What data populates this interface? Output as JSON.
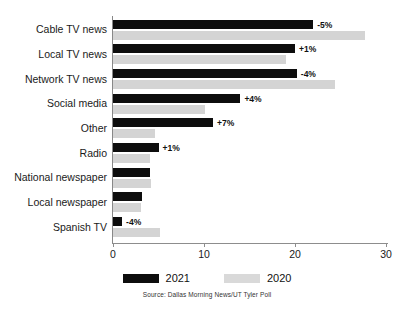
{
  "chart_data": {
    "type": "bar",
    "orientation": "horizontal",
    "title": "",
    "xlabel": "",
    "ylabel": "",
    "xlim": [
      0,
      30
    ],
    "xticks": [
      0,
      10,
      20,
      30
    ],
    "xtick_labels": [
      "0",
      "10",
      "20",
      "30"
    ],
    "grid": false,
    "legend_position": "bottom",
    "categories": [
      "Cable TV news",
      "Local TV news",
      "Network TV news",
      "Social media",
      "Other",
      "Radio",
      "National newspaper",
      "Local newspaper",
      "Spanish TV"
    ],
    "series": [
      {
        "name": "2021",
        "color": "#0d0d0d",
        "values": [
          22.0,
          20.0,
          20.2,
          14.0,
          11.0,
          5.0,
          4.1,
          3.2,
          1.0
        ]
      },
      {
        "name": "2020",
        "color": "#d4d4d4",
        "values": [
          27.7,
          19.0,
          24.4,
          10.1,
          4.6,
          4.1,
          4.2,
          3.1,
          5.2
        ]
      }
    ],
    "annotations": [
      "-5%",
      "+1%",
      "-4%",
      "+4%",
      "+7%",
      "+1%",
      "",
      "",
      "-4%"
    ],
    "source": "Source: Dallas Morning News/UT Tyler Poll"
  },
  "legend": {
    "items": [
      {
        "label": "2021",
        "swatch": "black-swatch"
      },
      {
        "label": "2020",
        "swatch": "gray-swatch"
      }
    ]
  }
}
